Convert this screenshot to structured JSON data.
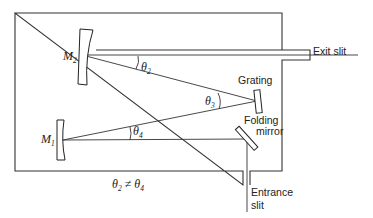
{
  "diagram": {
    "labels": {
      "m2": "M",
      "m2_sub": "2",
      "m1": "M",
      "m1_sub": "1",
      "theta2": "θ",
      "theta2_sub": "2",
      "theta3": "θ",
      "theta3_sub": "3",
      "theta4": "θ",
      "theta4_sub": "4",
      "exit_slit": "Exit slit",
      "grating": "Grating",
      "folding_line1": "Folding",
      "folding_line2": "mirror",
      "entrance_line1": "Entrance",
      "entrance_line2": "slit",
      "condition_a": "θ",
      "condition_a_sub": "2",
      "condition_op": " ≠ ",
      "condition_b": "θ",
      "condition_b_sub": "4"
    },
    "components": [
      {
        "id": "M2",
        "type": "concave-mirror"
      },
      {
        "id": "M1",
        "type": "concave-mirror"
      },
      {
        "id": "grating",
        "type": "diffraction-grating"
      },
      {
        "id": "folding-mirror",
        "type": "plane-mirror"
      },
      {
        "id": "exit-slit",
        "type": "slit"
      },
      {
        "id": "entrance-slit",
        "type": "slit"
      }
    ],
    "colors": {
      "line": "#333333",
      "background": "#ffffff"
    }
  }
}
